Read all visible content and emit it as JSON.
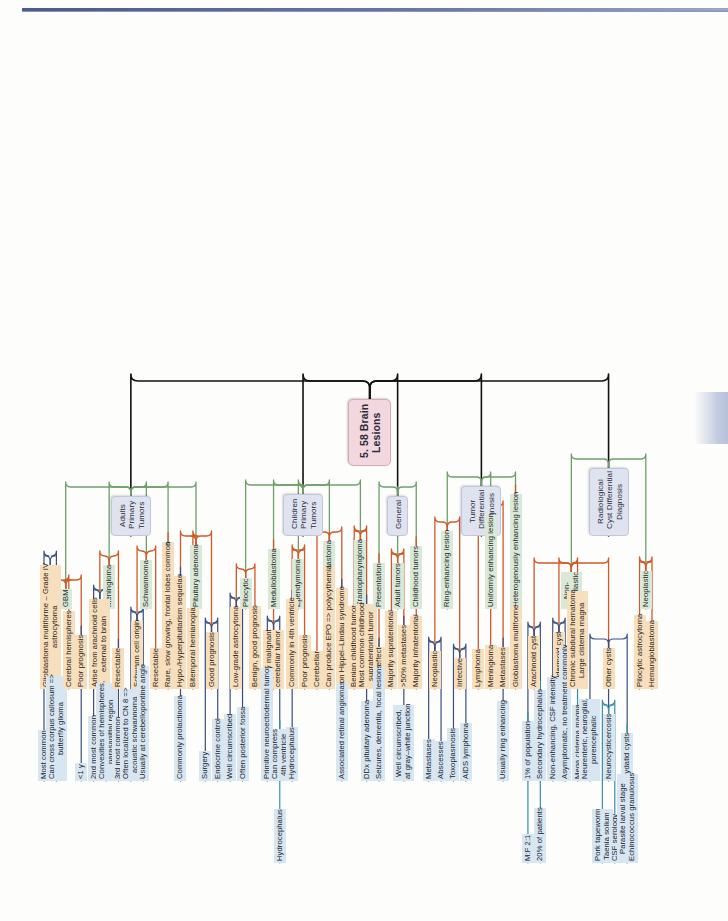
{
  "page": {
    "header_ghost": "5. 58 Brain Lesions",
    "title": "5. 58 Brain Lesions"
  },
  "center": {
    "label": "5. 58 Brain\nLesions",
    "color": "#f2d7de"
  },
  "branches": [
    {
      "id": "adults-primary-tumors",
      "label": "Adults\nPrimary\nTumors",
      "color": "#dfe3ef",
      "children": [
        {
          "label": "GBM",
          "level": "green",
          "children": [
            {
              "label": "Glioblastoma multiforme – Grade IV\nastrocytoma",
              "level": "orange",
              "children": [
                {
                  "label": "Most common",
                  "level": "blue"
                },
                {
                  "label": "Can cross corpus callosum =>\nbutterfly glioma",
                  "level": "blue"
                }
              ]
            },
            {
              "label": "Cerebral hemispheres",
              "level": "orange"
            },
            {
              "label": "Poor prognosis",
              "level": "orange",
              "children": [
                {
                  "label": "<1 y",
                  "level": "blue"
                }
              ]
            }
          ]
        },
        {
          "label": "Meningioma",
          "level": "green",
          "children": [
            {
              "label": "Arise from arachnoid cells\nexternal to brain",
              "level": "orange",
              "children": [
                {
                  "label": "2nd most common",
                  "level": "blue"
                },
                {
                  "label": "Convexities of hemispheres,\nparasagittal region",
                  "level": "blue"
                }
              ]
            },
            {
              "label": "Resectable",
              "level": "orange",
              "children": [
                {
                  "label": "3rd most common",
                  "level": "blue"
                }
              ]
            }
          ]
        },
        {
          "label": "Schwannoma",
          "level": "green",
          "children": [
            {
              "label": "Schwann cell origin",
              "level": "orange",
              "children": [
                {
                  "label": "Often localized to CN 8 =>\nacoustic schwannoma",
                  "level": "blue"
                },
                {
                  "label": "Usually at cerebellopontine angle",
                  "level": "blue"
                }
              ]
            },
            {
              "label": "Resectable",
              "level": "orange"
            }
          ]
        },
        {
          "label": "Oligodendroglioma",
          "level": "green",
          "children": [
            {
              "label": "Rare, slow growing, frontal lobes common",
              "level": "orange"
            }
          ]
        },
        {
          "label": "Pituitary adenoma",
          "level": "green",
          "children": [
            {
              "label": "Hypo-/Hyperpituitarism sequelae",
              "level": "orange",
              "children": [
                {
                  "label": "Commonly prolactinoma",
                  "level": "blue"
                }
              ]
            },
            {
              "label": "Bitemporal hemianopia",
              "level": "orange"
            },
            {
              "label": "Good prognosis",
              "level": "orange",
              "children": [
                {
                  "label": "Surgery",
                  "level": "blue"
                },
                {
                  "label": "Endocrine control",
                  "level": "blue"
                }
              ]
            }
          ]
        }
      ]
    },
    {
      "id": "children-primary-tumors",
      "label": "Children\nPrimary\nTumors",
      "color": "#dfe3ef",
      "children": [
        {
          "label": "Pilocytic",
          "level": "green",
          "children": [
            {
              "label": "Low-grade astrocytoma",
              "level": "orange",
              "children": [
                {
                  "label": "Well circumscribed",
                  "level": "blue"
                },
                {
                  "label": "Often posterior fossa",
                  "level": "blue"
                }
              ]
            },
            {
              "label": "Benign, good prognosis",
              "level": "orange"
            }
          ]
        },
        {
          "label": "Medulloblastoma",
          "level": "green",
          "children": [
            {
              "label": "Highly malignant\ncerebellar tumor",
              "level": "orange",
              "children": [
                {
                  "label": "Primitive neuroectodermal tumor",
                  "level": "blue"
                },
                {
                  "label": "Can compress\n4th ventricle",
                  "level": "blue",
                  "children": [
                    {
                      "label": "Hydrocephalus",
                      "level": "teal"
                    }
                  ]
                }
              ]
            }
          ]
        },
        {
          "label": "Ependymoma",
          "level": "green",
          "children": [
            {
              "label": "Commonly in 4th ventricle",
              "level": "orange",
              "children": [
                {
                  "label": "Hydrocephalus",
                  "level": "blue"
                }
              ]
            },
            {
              "label": "Poor prognosis",
              "level": "orange"
            }
          ]
        },
        {
          "label": "Hemangioblastoma",
          "level": "green",
          "children": [
            {
              "label": "Cerebellar",
              "level": "orange"
            },
            {
              "label": "Can produce EPO => polycythemia",
              "level": "orange"
            },
            {
              "label": "von Hippel–Lindau syndrome",
              "level": "orange",
              "children": [
                {
                  "label": "Associated retinal angiomas",
                  "level": "blue"
                }
              ]
            }
          ]
        },
        {
          "label": "Craniopharyngioma",
          "level": "green",
          "children": [
            {
              "label": "Benign childhood tumor",
              "level": "orange"
            },
            {
              "label": "Most common childhood\nsupratentorial tumor",
              "level": "orange",
              "children": [
                {
                  "label": "DDx pituitary adenoma",
                  "level": "blue"
                }
              ]
            }
          ]
        }
      ]
    },
    {
      "id": "general",
      "label": "General",
      "color": "#dfe3ef",
      "children": [
        {
          "label": "Presentation",
          "level": "green",
          "children": [
            {
              "label": "Mass effect",
              "level": "orange",
              "children": [
                {
                  "label": "Seizures, dementia, focal lesions",
                  "level": "blue"
                }
              ]
            }
          ]
        },
        {
          "label": "Adult tumors",
          "level": "green",
          "children": [
            {
              "label": "Majority supratentorial",
              "level": "orange"
            },
            {
              "label": ">50% metastases",
              "level": "orange",
              "children": [
                {
                  "label": "Well circumscribed,\nat gray–white junction",
                  "level": "blue"
                }
              ]
            }
          ]
        },
        {
          "label": "Childhood tumors",
          "level": "green",
          "children": [
            {
              "label": "Majority infratentorial",
              "level": "orange"
            }
          ]
        }
      ]
    },
    {
      "id": "tumor-differential-diagnosis",
      "label": "Tumor\nDifferential\nDiagnosis",
      "color": "#dfe3ef",
      "children": [
        {
          "label": "Ring-enhancing lesion",
          "level": "green",
          "children": [
            {
              "label": "Neoplastic",
              "level": "orange",
              "children": [
                {
                  "label": "Metastases",
                  "level": "blue"
                },
                {
                  "label": "Abscesses",
                  "level": "blue"
                }
              ]
            },
            {
              "label": "Infective",
              "level": "orange",
              "children": [
                {
                  "label": "Toxoplasmosis",
                  "level": "blue"
                },
                {
                  "label": "AIDS lymphoma",
                  "level": "blue"
                }
              ]
            }
          ]
        },
        {
          "label": "Uniformly enhancing lesion",
          "level": "green",
          "children": [
            {
              "label": "Lymphoma",
              "level": "orange"
            },
            {
              "label": "Meningioma",
              "level": "orange"
            },
            {
              "label": "Metastases",
              "level": "orange",
              "children": [
                {
                  "label": "Usually ring enhancing",
                  "level": "blue"
                }
              ]
            }
          ]
        },
        {
          "label": "Heterogenously enhancing lesion",
          "level": "green",
          "children": [
            {
              "label": "Globlastoma multiforme",
              "level": "orange"
            }
          ]
        }
      ]
    },
    {
      "id": "radiological-cyst-differential-diagnosis",
      "label": "Radiological\nCyst Differential\nDiagnosis",
      "color": "#dfe3ef",
      "children": [
        {
          "label": "Non-\nneoplastic",
          "level": "green",
          "children": [
            {
              "label": "Arachnoid cyst",
              "level": "orange",
              "children": [
                {
                  "label": "1% of population",
                  "level": "blue",
                  "children": [
                    {
                      "label": "M:F 2:1",
                      "level": "teal"
                    }
                  ]
                },
                {
                  "label": "Secondary hydrocephalus",
                  "level": "blue",
                  "children": [
                    {
                      "label": "20% of patients",
                      "level": "teal"
                    }
                  ]
                }
              ]
            },
            {
              "label": "Epidermoid cyst",
              "level": "orange",
              "children": [
                {
                  "label": "Non-enhancing, CSF intensity",
                  "level": "blue"
                },
                {
                  "label": "Asymptomatic, no treatment commonly",
                  "level": "blue"
                }
              ]
            },
            {
              "label": "Chronic subdural hematoma\nLarge cisterna magna",
              "level": "orange",
              "children": [
                {
                  "label": "Mega cisterna magna",
                  "level": "teal"
                }
              ]
            },
            {
              "label": "Other cysts",
              "level": "orange",
              "children": [
                {
                  "label": "Neurenteric, neuroglial,\nporencephalic",
                  "level": "blue"
                },
                {
                  "label": "Neurocysticercosis",
                  "level": "blue",
                  "children": [
                    {
                      "label": "Pork tapeworm\nTaenia solium",
                      "level": "teal"
                    },
                    {
                      "label": "CSF serology",
                      "level": "teal"
                    }
                  ]
                },
                {
                  "label": "Hydatid cysts",
                  "level": "blue",
                  "children": [
                    {
                      "label": "Parasite larval stage\nEchinococcus granulosus",
                      "level": "teal"
                    }
                  ]
                }
              ]
            }
          ]
        },
        {
          "label": "Neoplastic",
          "level": "green",
          "children": [
            {
              "label": "Pilocytic astrocytoma",
              "level": "orange"
            },
            {
              "label": "Hemangioblastoma",
              "level": "orange"
            }
          ]
        }
      ]
    }
  ],
  "colors": {
    "center": "#f2d7de",
    "level1": "#dfe3ef",
    "green": "#d9e8d8",
    "orange": "#f7dfbd",
    "blue": "#d8e6f2",
    "link_green": "#6f9e6b",
    "link_orange": "#cf5a28",
    "link_navy": "#3a4f80",
    "link_teal": "#3a90a8",
    "link_black": "#111111"
  }
}
